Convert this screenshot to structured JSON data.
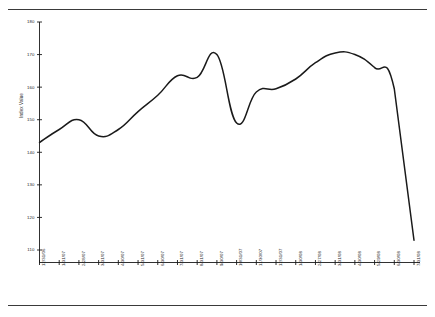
{
  "chart_data": {
    "type": "line",
    "title": "",
    "subtitle": "",
    "xlabel": "",
    "ylabel": "Index Value",
    "ylim": [
      110,
      180
    ],
    "yticks": [
      110,
      120,
      130,
      140,
      150,
      160,
      170,
      180
    ],
    "grid": false,
    "legend": null,
    "line_color": "#1a1a1a",
    "categories": [
      "12/31/06",
      "1/31/07",
      "2/28/07",
      "3/31/07",
      "4/30/07",
      "5/31/07",
      "6/30/07",
      "7/31/07",
      "8/31/07",
      "9/30/07",
      "10/31/07",
      "11/30/07",
      "12/31/07",
      "1/30/08",
      "2/27/08",
      "3/31/08",
      "4/30/08",
      "5/29/08",
      "6/30/08",
      "7/31/08"
    ],
    "series": [
      {
        "name": "Index Value",
        "values": [
          143.0,
          147.0,
          150.0,
          145.0,
          147.0,
          152.5,
          157.5,
          163.5,
          163.0,
          170.0,
          149.0,
          158.5,
          159.5,
          162.5,
          167.5,
          170.5,
          170.0,
          166.0,
          159.5,
          113.0
        ]
      }
    ]
  },
  "axes": {
    "y_axis_name": "y-axis",
    "x_axis_name": "x-axis"
  },
  "frame": {
    "top_rule": "",
    "bottom_rule": ""
  }
}
